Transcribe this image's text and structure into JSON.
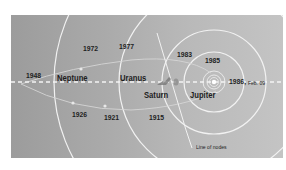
{
  "diagram": {
    "colors": {
      "panel_left": "#9c9c9c",
      "panel_right": "#c4c4c4",
      "orbit_line": "#f2f2f2",
      "text": "#1e1e1e"
    },
    "planets": [
      {
        "name": "Neptune"
      },
      {
        "name": "Uranus"
      },
      {
        "name": "Saturn"
      },
      {
        "name": "Jupiter"
      }
    ],
    "comet_positions": [
      {
        "year": "1948"
      },
      {
        "year": "1972"
      },
      {
        "year": "1977"
      },
      {
        "year": "1983"
      },
      {
        "year": "1985"
      },
      {
        "year": "1986,",
        "note": "Feb. 09"
      },
      {
        "year": "1926"
      },
      {
        "year": "1921"
      },
      {
        "year": "1915"
      }
    ],
    "line_of_nodes_label": "Line of nodes",
    "icons": [
      "spacecraft-icon",
      "spacecraft-icon",
      "sun-icon"
    ]
  }
}
